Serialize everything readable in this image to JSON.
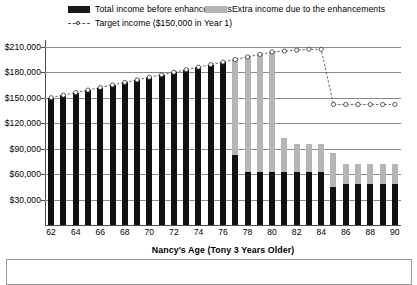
{
  "legend": {
    "total_income_label": "Total income before enhancements",
    "extra_income_label": "Extra income due to the enhancements",
    "target_income_label": "Target income ($150,000 in Year 1)",
    "black_swatch": "#1a1a1a",
    "gray_swatch": "#b3b3b3",
    "line_marker": "dashed-line-open-circle"
  },
  "axes": {
    "xlabel": "Nancy's Age (Tony 3 Years Older)",
    "ylabel": "",
    "ytick_labels": [
      "$30,000",
      "$60,000",
      "$90,000",
      "$120,000",
      "$150,000",
      "$180,000",
      "$210,000"
    ],
    "xtick_labels": [
      "62",
      "64",
      "66",
      "68",
      "70",
      "72",
      "74",
      "76",
      "78",
      "80",
      "82",
      "84",
      "86",
      "88",
      "90"
    ]
  },
  "chart_data": {
    "type": "bar",
    "title": "",
    "subtitle": "",
    "xlabel": "Nancy's Age (Tony 3 Years Older)",
    "ylabel": "",
    "ylim": [
      0,
      218000
    ],
    "ytick_step": 30000,
    "grid": true,
    "stacked": true,
    "legend_position": "top",
    "categories": [
      62,
      63,
      64,
      65,
      66,
      67,
      68,
      69,
      70,
      71,
      72,
      73,
      74,
      75,
      76,
      77,
      78,
      79,
      80,
      81,
      82,
      83,
      84,
      85,
      86,
      87,
      88,
      89,
      90
    ],
    "series": [
      {
        "name": "Total income before enhancements",
        "color": "#111111",
        "values": [
          150000,
          153000,
          156000,
          159000,
          162000,
          165000,
          168000,
          171000,
          174000,
          177000,
          180000,
          183000,
          186000,
          189000,
          192000,
          83000,
          62000,
          62000,
          62000,
          62000,
          62000,
          63000,
          63000,
          45000,
          48000,
          48000,
          48000,
          48000,
          48000
        ]
      },
      {
        "name": "Extra income due to the enhancements",
        "color": "#b5b5b5",
        "values": [
          0,
          0,
          0,
          0,
          0,
          0,
          0,
          0,
          0,
          0,
          0,
          0,
          0,
          0,
          0,
          112000,
          136000,
          139000,
          142000,
          40000,
          33000,
          32000,
          33000,
          40000,
          24000,
          24000,
          24000,
          24000,
          24000
        ]
      },
      {
        "name": "Target income ($150,000 in Year 1)",
        "type": "line",
        "style": "dashed",
        "marker": "open-circle",
        "color": "#555555",
        "values": [
          150000,
          153000,
          156000,
          159000,
          162000,
          165000,
          168000,
          171000,
          174000,
          177000,
          180000,
          183000,
          186000,
          189000,
          192000,
          195000,
          198000,
          201000,
          204000,
          205000,
          206000,
          207000,
          207000,
          142000,
          142000,
          142000,
          142000,
          142000,
          142000
        ]
      }
    ]
  }
}
